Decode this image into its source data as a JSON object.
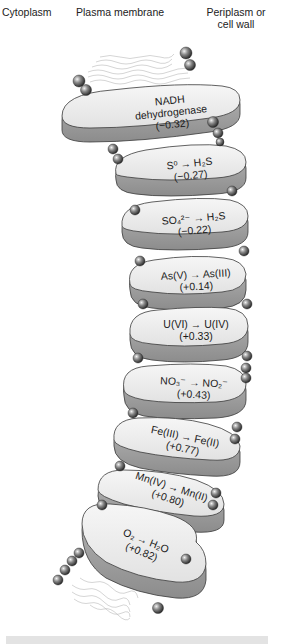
{
  "headers": {
    "left": "Cytoplasm",
    "center": "Plasma membrane",
    "right_line1": "Periplasm or",
    "right_line2": "cell wall"
  },
  "complexes": [
    {
      "line1": "NADH",
      "line2": "dehydrogenase",
      "potential": "(−0.32)"
    },
    {
      "line1": "S⁰ → H₂S",
      "potential": "(−0.27)"
    },
    {
      "line1": "SO₄²⁻ → H₂S",
      "potential": "(−0.22)"
    },
    {
      "line1": "As(V) → As(III)",
      "potential": "(+0.14)"
    },
    {
      "line1": "U(VI) → U(IV)",
      "potential": "(+0.33)"
    },
    {
      "line1": "NO₃⁻ → NO₂⁻",
      "potential": "(+0.43)"
    },
    {
      "line1": "Fe(III) → Fe(II)",
      "potential": "(+0.77)"
    },
    {
      "line1": "Mn(IV) → Mn(II)",
      "potential": "(+0.80)"
    },
    {
      "line1": "O₂ → H₂O",
      "potential": "(+0.82)"
    }
  ],
  "colors": {
    "protein_top": "#ececec",
    "protein_side": "#9e9e9e",
    "protein_outline": "#3a3a3a",
    "lipid_head": "#7a7a7a",
    "lipid_tail": "#b5b5b5",
    "bottom_bar": "#e3e3e3"
  }
}
